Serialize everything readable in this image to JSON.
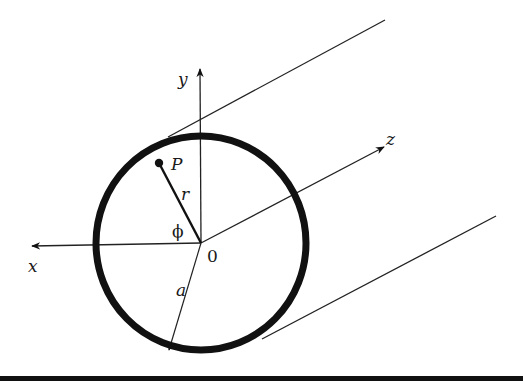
{
  "figure": {
    "colors": {
      "stroke": "#111111",
      "background": "#ffffff"
    },
    "labels": {
      "x_axis": "x",
      "y_axis": "y",
      "z_axis": "z",
      "origin": "0",
      "point": "P",
      "radial_distance": "r",
      "angle": "ϕ",
      "radius": "a"
    }
  }
}
